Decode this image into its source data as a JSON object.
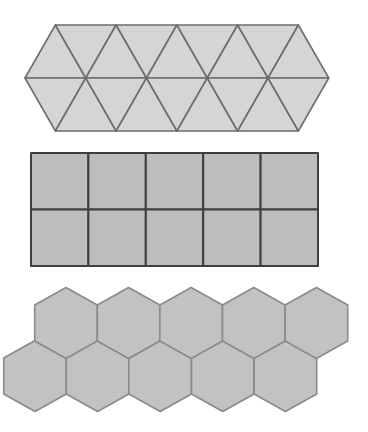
{
  "figure": {
    "tessellations": [
      {
        "name": "triangles",
        "rows": 2,
        "count": 18,
        "fill": "#d5d5d5",
        "stroke": "#6e6e6e"
      },
      {
        "name": "squares",
        "rows": 2,
        "columns": 5,
        "count": 10,
        "fill": "#bdbdbd",
        "stroke": "#3f3f3f"
      },
      {
        "name": "hexagons",
        "rows": 2,
        "count": 10,
        "fill": "#c2c2c2",
        "stroke": "#8a8a8a"
      }
    ]
  }
}
